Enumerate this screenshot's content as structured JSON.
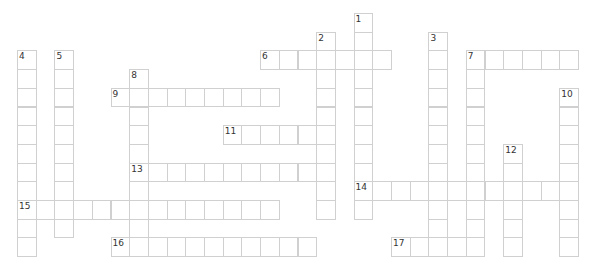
{
  "puzzle": {
    "cell_size": 18.7,
    "origin": {
      "x": 17,
      "y": 13
    },
    "border_color": "#d0d0d0",
    "words": [
      {
        "number": "1",
        "direction": "down",
        "row": 0,
        "col": 18,
        "length": 11
      },
      {
        "number": "2",
        "direction": "down",
        "row": 1,
        "col": 16,
        "length": 10
      },
      {
        "number": "3",
        "direction": "down",
        "row": 1,
        "col": 22,
        "length": 12
      },
      {
        "number": "4",
        "direction": "down",
        "row": 2,
        "col": 0,
        "length": 11
      },
      {
        "number": "5",
        "direction": "down",
        "row": 2,
        "col": 2,
        "length": 10
      },
      {
        "number": "6",
        "direction": "across",
        "row": 2,
        "col": 13,
        "length": 7
      },
      {
        "number": "7",
        "direction": "across",
        "row": 2,
        "col": 24,
        "length": 6
      },
      {
        "number": "7",
        "direction": "down",
        "row": 2,
        "col": 24,
        "length": 10
      },
      {
        "number": "8",
        "direction": "down",
        "row": 3,
        "col": 6,
        "length": 10
      },
      {
        "number": "9",
        "direction": "across",
        "row": 4,
        "col": 5,
        "length": 9
      },
      {
        "number": "10",
        "direction": "down",
        "row": 4,
        "col": 29,
        "length": 9
      },
      {
        "number": "11",
        "direction": "across",
        "row": 6,
        "col": 11,
        "length": 6
      },
      {
        "number": "12",
        "direction": "down",
        "row": 7,
        "col": 26,
        "length": 6
      },
      {
        "number": "13",
        "direction": "across",
        "row": 8,
        "col": 6,
        "length": 11
      },
      {
        "number": "14",
        "direction": "across",
        "row": 9,
        "col": 18,
        "length": 12
      },
      {
        "number": "15",
        "direction": "across",
        "row": 10,
        "col": 0,
        "length": 14
      },
      {
        "number": "16",
        "direction": "across",
        "row": 12,
        "col": 5,
        "length": 11
      },
      {
        "number": "17",
        "direction": "across",
        "row": 12,
        "col": 20,
        "length": 5
      }
    ]
  }
}
